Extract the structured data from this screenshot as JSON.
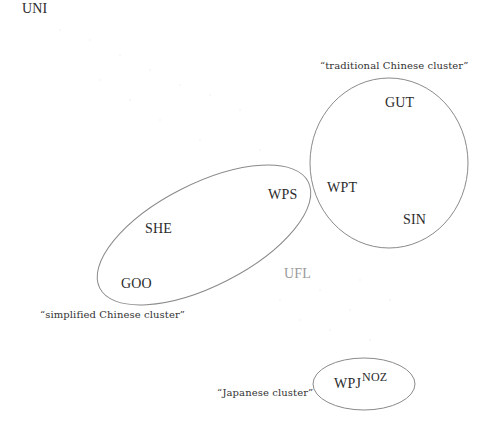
{
  "diagram": {
    "type": "cluster-diagram",
    "nodes": {
      "uni": "UNI",
      "gut": "GUT",
      "wpt": "WPT",
      "sin": "SIN",
      "wps": "WPS",
      "she": "SHE",
      "goo": "GOO",
      "ufl": "UFL",
      "wpj": "WPJ",
      "noz": "NOZ"
    },
    "clusters": {
      "traditional": {
        "caption": "“traditional Chinese cluster”",
        "members": [
          "GUT",
          "WPT",
          "SIN"
        ]
      },
      "simplified": {
        "caption": "“simplified Chinese cluster”",
        "members": [
          "WPS",
          "SHE",
          "GOO"
        ]
      },
      "japanese": {
        "caption": "“Japanese cluster”",
        "members": [
          "WPJ",
          "NOZ"
        ]
      }
    },
    "unclustered": [
      "UNI",
      "UFL"
    ],
    "colors": {
      "outline": "#8a8a8a",
      "label": "#2b2b2b",
      "faint_label": "#9a9a9a",
      "background": "#ffffff"
    }
  }
}
